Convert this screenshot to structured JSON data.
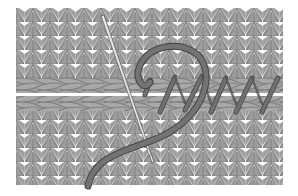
{
  "figure": {
    "colors": {
      "background": "#ffffff",
      "fabric": "#9e9e9e",
      "fabric_outline": "#5a5a5a",
      "gaps": "#ffffff",
      "yarn": "#6e6e6e",
      "yarn_outline": "#444444",
      "needle": "#d8d8d8"
    }
  }
}
